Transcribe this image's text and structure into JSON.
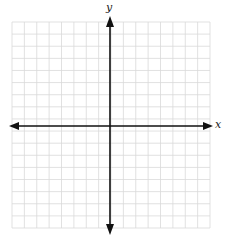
{
  "diagram": {
    "type": "coordinate-plane",
    "axes": {
      "x_label": "x",
      "y_label": "y"
    },
    "grid": {
      "left": 12,
      "top": 22,
      "right": 210,
      "bottom": 228,
      "cell": 12.4,
      "cols": 16,
      "rows": 17,
      "line_color": "#d9d9d9"
    },
    "origin": {
      "px": 110,
      "py": 126
    },
    "axis_color": "#111111"
  }
}
